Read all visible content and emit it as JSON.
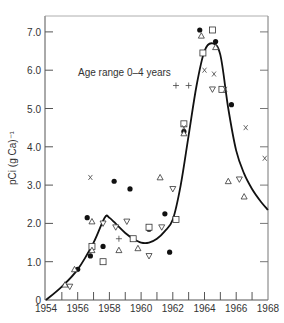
{
  "chart_data": {
    "type": "scatter",
    "title": "",
    "annotation": "Age range 0–4 years",
    "xlabel": "",
    "ylabel": "pCi (g Ca)⁻¹",
    "xlim": [
      1954,
      1968
    ],
    "ylim": [
      0,
      7.3
    ],
    "grid": false,
    "legend": "none",
    "x_ticks": [
      "1954",
      "1956",
      "1958",
      "1960",
      "1962",
      "1964",
      "1966",
      "1968"
    ],
    "y_ticks": [
      "0",
      "1.0",
      "2.0",
      "3.0",
      "4.0",
      "5.0",
      "6.0",
      "7.0"
    ],
    "series": [
      {
        "name": "filled circle",
        "marker": "circle-filled",
        "points": [
          [
            1956.0,
            0.8
          ],
          [
            1956.6,
            2.15
          ],
          [
            1956.8,
            1.15
          ],
          [
            1957.6,
            1.4
          ],
          [
            1958.3,
            3.1
          ],
          [
            1959.3,
            2.9
          ],
          [
            1960.5,
            1.85
          ],
          [
            1961.5,
            2.25
          ],
          [
            1961.8,
            1.25
          ],
          [
            1962.7,
            4.4
          ],
          [
            1963.7,
            7.05
          ],
          [
            1964.7,
            6.75
          ],
          [
            1965.7,
            5.1
          ]
        ]
      },
      {
        "name": "open square",
        "marker": "square",
        "points": [
          [
            1956.9,
            1.4
          ],
          [
            1957.6,
            1.0
          ],
          [
            1959.5,
            1.6
          ],
          [
            1960.5,
            1.9
          ],
          [
            1962.2,
            2.1
          ],
          [
            1962.7,
            4.6
          ],
          [
            1963.9,
            6.45
          ],
          [
            1964.5,
            7.05
          ],
          [
            1965.1,
            5.5
          ]
        ]
      },
      {
        "name": "triangle up",
        "marker": "triangle-up",
        "points": [
          [
            1955.2,
            0.4
          ],
          [
            1955.8,
            0.8
          ],
          [
            1956.9,
            1.3
          ],
          [
            1956.9,
            2.05
          ],
          [
            1958.6,
            1.3
          ],
          [
            1959.8,
            1.35
          ],
          [
            1961.2,
            3.2
          ],
          [
            1962.7,
            4.35
          ],
          [
            1963.8,
            6.9
          ],
          [
            1964.7,
            6.6
          ],
          [
            1965.5,
            3.1
          ],
          [
            1966.5,
            2.7
          ]
        ]
      },
      {
        "name": "triangle down",
        "marker": "triangle-down",
        "points": [
          [
            1955.5,
            0.35
          ],
          [
            1957.6,
            2.0
          ],
          [
            1958.4,
            1.9
          ],
          [
            1959.1,
            2.05
          ],
          [
            1960.5,
            1.15
          ],
          [
            1961.3,
            1.9
          ],
          [
            1962.0,
            2.9
          ],
          [
            1964.5,
            5.5
          ],
          [
            1966.2,
            3.15
          ]
        ]
      },
      {
        "name": "cross x",
        "marker": "x",
        "points": [
          [
            1956.8,
            3.2
          ],
          [
            1962.7,
            4.5
          ],
          [
            1964.0,
            6.0
          ],
          [
            1964.6,
            5.9
          ],
          [
            1965.3,
            5.5
          ],
          [
            1966.6,
            4.5
          ],
          [
            1967.8,
            3.7
          ]
        ]
      },
      {
        "name": "plus",
        "marker": "plus",
        "points": [
          [
            1958.6,
            1.6
          ],
          [
            1962.2,
            5.6
          ],
          [
            1963.0,
            5.6
          ]
        ]
      }
    ],
    "fitted_curve": {
      "name": "fitted curve",
      "points": [
        [
          1954.0,
          0.0
        ],
        [
          1955.0,
          0.35
        ],
        [
          1956.0,
          0.8
        ],
        [
          1957.0,
          1.5
        ],
        [
          1957.7,
          2.15
        ],
        [
          1958.0,
          2.15
        ],
        [
          1958.5,
          1.95
        ],
        [
          1959.0,
          1.75
        ],
        [
          1959.5,
          1.6
        ],
        [
          1960.0,
          1.5
        ],
        [
          1960.5,
          1.5
        ],
        [
          1961.0,
          1.6
        ],
        [
          1961.5,
          1.8
        ],
        [
          1962.0,
          2.1
        ],
        [
          1962.5,
          3.0
        ],
        [
          1963.0,
          4.3
        ],
        [
          1963.5,
          5.6
        ],
        [
          1964.0,
          6.5
        ],
        [
          1964.5,
          6.7
        ],
        [
          1965.0,
          6.4
        ],
        [
          1965.5,
          5.0
        ],
        [
          1966.0,
          3.9
        ],
        [
          1966.5,
          3.3
        ],
        [
          1967.0,
          2.9
        ],
        [
          1967.5,
          2.6
        ],
        [
          1968.0,
          2.35
        ]
      ]
    }
  }
}
